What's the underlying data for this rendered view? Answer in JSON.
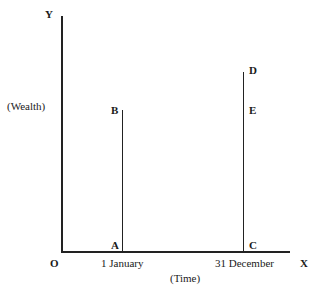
{
  "diagram": {
    "axes": {
      "y_label": "Y",
      "y_title": "(Wealth)",
      "x_label": "X",
      "x_title": "(Time)",
      "origin_label": "O"
    },
    "ticks": [
      {
        "label": "1 January",
        "x": 122
      },
      {
        "label": "31 December",
        "x": 243
      }
    ],
    "points": {
      "A": "A",
      "B": "B",
      "C": "C",
      "D": "D",
      "E": "E"
    },
    "lines": [
      {
        "name": "AB",
        "x": 122,
        "y_top": 110,
        "y_bottom": 251
      },
      {
        "name": "CD",
        "x": 243,
        "y_top": 72,
        "y_bottom": 251
      }
    ],
    "line_color": "#222222"
  }
}
